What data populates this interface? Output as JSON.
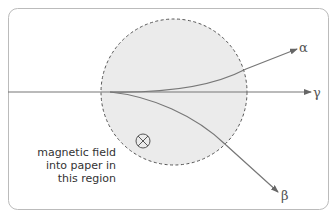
{
  "diagram": {
    "labels": {
      "alpha": "α",
      "beta": "β",
      "gamma": "γ",
      "field_line1": "magnetic field",
      "field_line2": "into paper in",
      "field_line3": "this region"
    },
    "symbols": {
      "field_direction": "into-paper-cross-icon"
    },
    "colors": {
      "field_region_fill": "#ebebeb",
      "field_region_border": "#555555",
      "ray": "#777777",
      "frame": "#bbbbbb"
    }
  }
}
